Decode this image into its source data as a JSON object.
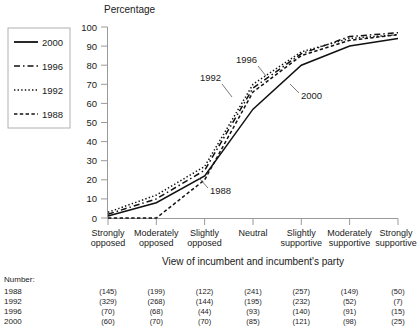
{
  "chart_data": {
    "type": "line",
    "title": "",
    "ylabel": "Percentage",
    "xlabel": "View of incumbent and incumbent's party",
    "ylim": [
      0,
      100
    ],
    "yticks": [
      0,
      10,
      20,
      30,
      40,
      50,
      60,
      70,
      80,
      90,
      100
    ],
    "grid": false,
    "legend_position": "top-left-outside",
    "categories": [
      "Strongly opposed",
      "Moderately opposed",
      "Slightly opposed",
      "Neutral",
      "Slightly supportive",
      "Moderately supportive",
      "Strongly supportive"
    ],
    "series": [
      {
        "name": "2000",
        "style": "solid",
        "values": [
          1,
          8,
          22,
          57,
          80,
          90,
          94
        ]
      },
      {
        "name": "1996",
        "style": "dash-dot",
        "values": [
          2,
          10,
          25,
          68,
          86,
          95,
          97
        ]
      },
      {
        "name": "1992",
        "style": "dotted",
        "values": [
          3,
          12,
          27,
          70,
          87,
          94,
          96
        ]
      },
      {
        "name": "1988",
        "style": "dashed",
        "values": [
          0,
          0,
          20,
          66,
          85,
          93,
          96
        ]
      }
    ],
    "annotations": [
      {
        "text": "1988",
        "x": 210,
        "y": 192
      },
      {
        "text": "1992",
        "x": 202,
        "y": 80
      },
      {
        "text": "1996",
        "x": 237,
        "y": 62
      },
      {
        "text": "2000",
        "x": 300,
        "y": 96
      }
    ]
  },
  "legend": {
    "entries": [
      {
        "label": "2000",
        "style": "solid"
      },
      {
        "label": "1996",
        "style": "dash-dot"
      },
      {
        "label": "1992",
        "style": "dotted"
      },
      {
        "label": "1988",
        "style": "dashed"
      }
    ]
  },
  "axis": {
    "y_title": "Percentage",
    "x_title": "View of incumbent and incumbent's party",
    "y_ticks": [
      "100",
      "90",
      "80",
      "70",
      "60",
      "50",
      "40",
      "30",
      "20",
      "10",
      "0"
    ],
    "x_ticks": [
      [
        "Strongly",
        "opposed"
      ],
      [
        "Moderately",
        "opposed"
      ],
      [
        "Slightly",
        "opposed"
      ],
      [
        "Neutral",
        ""
      ],
      [
        "Slightly",
        "supportive"
      ],
      [
        "Moderately",
        "supportive"
      ],
      [
        "Strongly",
        "supportive"
      ]
    ]
  },
  "number_table": {
    "caption": "Number:",
    "rows": [
      {
        "year": "1988",
        "values": [
          "(145)",
          "(199)",
          "(122)",
          "(241)",
          "(257)",
          "(149)",
          "(50)"
        ]
      },
      {
        "year": "1992",
        "values": [
          "(329)",
          "(268)",
          "(144)",
          "(195)",
          "(232)",
          "(52)",
          "(7)"
        ]
      },
      {
        "year": "1996",
        "values": [
          "(70)",
          "(68)",
          "(44)",
          "(93)",
          "(140)",
          "(91)",
          "(15)"
        ]
      },
      {
        "year": "2000",
        "values": [
          "(60)",
          "(70)",
          "(70)",
          "(85)",
          "(121)",
          "(98)",
          "(25)"
        ]
      }
    ]
  },
  "colors": {
    "ink": "#1a1a1a",
    "axis": "#9a9a9a",
    "background": "#ffffff"
  }
}
